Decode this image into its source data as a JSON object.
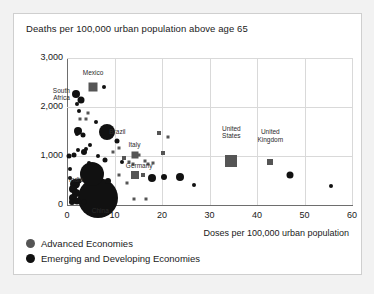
{
  "chart_data": {
    "type": "scatter",
    "title": "Deaths per 100,000 urban population above age 65",
    "xlabel": "Doses per 100,000 urban population",
    "ylabel": "",
    "xlim": [
      0,
      60
    ],
    "ylim": [
      0,
      3000
    ],
    "xticks": [
      "0",
      "10",
      "20",
      "30",
      "40",
      "50",
      "60"
    ],
    "yticks": [
      "0",
      "1,000",
      "2,000",
      "3,000"
    ],
    "xtick_values": [
      0,
      10,
      20,
      30,
      40,
      50,
      60
    ],
    "ytick_values": [
      0,
      1000,
      2000,
      3000
    ],
    "grid": true,
    "legend_position": "below-plot-left",
    "legend": [
      {
        "name": "Advanced Economies",
        "marker": "circle",
        "color": "#555555"
      },
      {
        "name": "Emerging and Developing Economies",
        "marker": "circle",
        "color": "#111111"
      }
    ],
    "annotations": [
      {
        "text": "Mexico",
        "x": 5.5,
        "y": 2700,
        "align": "center"
      },
      {
        "text": "South\nAfrica",
        "x": 0.6,
        "y": 2270,
        "align": "left"
      },
      {
        "text": "Brazil",
        "x": 8.9,
        "y": 1480,
        "align": "right"
      },
      {
        "text": "Italy",
        "x": 14.2,
        "y": 1230,
        "align": "center"
      },
      {
        "text": "Germany",
        "x": 15.2,
        "y": 790,
        "align": "center"
      },
      {
        "text": "India",
        "x": 1.9,
        "y": 520,
        "align": "center"
      },
      {
        "text": "China",
        "x": 7.0,
        "y": -130,
        "align": "center"
      },
      {
        "text": "United\nStates",
        "x": 34.6,
        "y": 1560,
        "align": "center"
      },
      {
        "text": "United\nKingdom",
        "x": 42.8,
        "y": 1480,
        "align": "center"
      }
    ],
    "series": [
      {
        "name": "Advanced Economies",
        "marker": "square",
        "color": "#555555",
        "points": [
          {
            "x": 5.5,
            "y": 2400,
            "size": 9,
            "label": "Mexico"
          },
          {
            "x": 14.3,
            "y": 1030,
            "size": 7,
            "label": "Italy"
          },
          {
            "x": 14.4,
            "y": 620,
            "size": 8,
            "label": "Germany"
          },
          {
            "x": 34.6,
            "y": 900,
            "size": 12,
            "label": "United States"
          },
          {
            "x": 42.8,
            "y": 880,
            "size": 6,
            "label": "United Kingdom"
          },
          {
            "x": 12.0,
            "y": 960,
            "size": 4
          },
          {
            "x": 13.1,
            "y": 870,
            "size": 3
          },
          {
            "x": 13.8,
            "y": 830,
            "size": 3
          },
          {
            "x": 15.2,
            "y": 1020,
            "size": 3
          },
          {
            "x": 16.4,
            "y": 900,
            "size": 3
          },
          {
            "x": 17.0,
            "y": 840,
            "size": 3
          },
          {
            "x": 19.4,
            "y": 1470,
            "size": 4
          },
          {
            "x": 20.3,
            "y": 1060,
            "size": 4
          },
          {
            "x": 18.2,
            "y": 860,
            "size": 3
          },
          {
            "x": 10.9,
            "y": 1160,
            "size": 3
          },
          {
            "x": 9.6,
            "y": 1080,
            "size": 3
          },
          {
            "x": 16.0,
            "y": 620,
            "size": 4
          },
          {
            "x": 11.0,
            "y": 620,
            "size": 3
          },
          {
            "x": 12.7,
            "y": 440,
            "size": 3
          },
          {
            "x": 14.0,
            "y": 120,
            "size": 3
          },
          {
            "x": 16.7,
            "y": 120,
            "size": 3
          },
          {
            "x": 5.4,
            "y": 620,
            "size": 9
          },
          {
            "x": 5.9,
            "y": 430,
            "size": 4
          },
          {
            "x": 7.2,
            "y": 240,
            "size": 3
          },
          {
            "x": 4.4,
            "y": 1880,
            "size": 3
          },
          {
            "x": 4.0,
            "y": 1760,
            "size": 3
          },
          {
            "x": 2.7,
            "y": 1760,
            "size": 3
          },
          {
            "x": 21.2,
            "y": 1380,
            "size": 3
          }
        ]
      },
      {
        "name": "Emerging and Developing Economies",
        "marker": "circle",
        "color": "#111111",
        "points": [
          {
            "x": 6.6,
            "y": 150,
            "size": 40,
            "label": "China"
          },
          {
            "x": 8.5,
            "y": 1490,
            "size": 16,
            "label": "Brazil"
          },
          {
            "x": 1.9,
            "y": 2260,
            "size": 8,
            "label": "South Africa"
          },
          {
            "x": 5.2,
            "y": 630,
            "size": 24
          },
          {
            "x": 1.6,
            "y": 430,
            "size": 10
          },
          {
            "x": 1.3,
            "y": 330,
            "size": 8,
            "label": "India"
          },
          {
            "x": 1.9,
            "y": 250,
            "size": 8
          },
          {
            "x": 1.2,
            "y": 150,
            "size": 8
          },
          {
            "x": 2.1,
            "y": 80,
            "size": 7
          },
          {
            "x": 1.0,
            "y": 60,
            "size": 6
          },
          {
            "x": 2.5,
            "y": 500,
            "size": 5
          },
          {
            "x": 0.7,
            "y": 560,
            "size": 4
          },
          {
            "x": 0.6,
            "y": 740,
            "size": 4
          },
          {
            "x": 0.5,
            "y": 1010,
            "size": 5
          },
          {
            "x": 1.4,
            "y": 1030,
            "size": 5
          },
          {
            "x": 2.3,
            "y": 1120,
            "size": 4
          },
          {
            "x": 3.5,
            "y": 1090,
            "size": 6
          },
          {
            "x": 2.1,
            "y": 1440,
            "size": 4
          },
          {
            "x": 2.4,
            "y": 1520,
            "size": 8
          },
          {
            "x": 3.3,
            "y": 1420,
            "size": 5
          },
          {
            "x": 2.0,
            "y": 2070,
            "size": 4
          },
          {
            "x": 2.6,
            "y": 1920,
            "size": 4
          },
          {
            "x": 3.0,
            "y": 2150,
            "size": 7
          },
          {
            "x": 7.8,
            "y": 2400,
            "size": 4
          },
          {
            "x": 4.9,
            "y": 1220,
            "size": 4
          },
          {
            "x": 6.5,
            "y": 990,
            "size": 4
          },
          {
            "x": 7.9,
            "y": 910,
            "size": 5
          },
          {
            "x": 10.6,
            "y": 1300,
            "size": 5
          },
          {
            "x": 8.6,
            "y": 480,
            "size": 6
          },
          {
            "x": 9.8,
            "y": 120,
            "size": 4
          },
          {
            "x": 11.6,
            "y": 870,
            "size": 4
          },
          {
            "x": 17.9,
            "y": 550,
            "size": 8
          },
          {
            "x": 20.4,
            "y": 580,
            "size": 6
          },
          {
            "x": 23.8,
            "y": 570,
            "size": 8
          },
          {
            "x": 26.7,
            "y": 400,
            "size": 4
          },
          {
            "x": 47.0,
            "y": 620,
            "size": 7
          },
          {
            "x": 55.5,
            "y": 380,
            "size": 4
          },
          {
            "x": 3.6,
            "y": 60,
            "size": 5
          },
          {
            "x": 4.6,
            "y": 860,
            "size": 4
          },
          {
            "x": 6.2,
            "y": 1700,
            "size": 4
          },
          {
            "x": 3.9,
            "y": 1140,
            "size": 4
          }
        ]
      }
    ]
  }
}
